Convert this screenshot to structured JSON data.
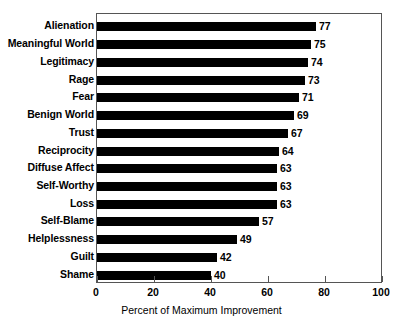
{
  "chart_data": {
    "type": "bar",
    "orientation": "horizontal",
    "title": "",
    "xlabel": "Percent of Maximum Improvement",
    "ylabel": "",
    "xlim": [
      0,
      100
    ],
    "xticks": [
      0,
      20,
      40,
      60,
      80,
      100
    ],
    "xtick_labels": [
      "0",
      "20",
      "40",
      "60",
      "80",
      "100"
    ],
    "grid": false,
    "legend": null,
    "bar_color": "#000000",
    "frame_color": "#555555",
    "background_color": "#ffffff",
    "show_value_labels": true,
    "categories": [
      "Alienation",
      "Meaningful World",
      "Legitimacy",
      "Rage",
      "Fear",
      "Benign World",
      "Trust",
      "Reciprocity",
      "Diffuse Affect",
      "Self-Worthy",
      "Loss",
      "Self-Blame",
      "Helplessness",
      "Guilt",
      "Shame"
    ],
    "values": [
      77,
      75,
      74,
      73,
      71,
      69,
      67,
      64,
      63,
      63,
      63,
      57,
      49,
      42,
      40
    ],
    "value_labels": [
      "77",
      "75",
      "74",
      "73",
      "71",
      "69",
      "67",
      "64",
      "63",
      "63",
      "63",
      "57",
      "49",
      "42",
      "40"
    ]
  }
}
